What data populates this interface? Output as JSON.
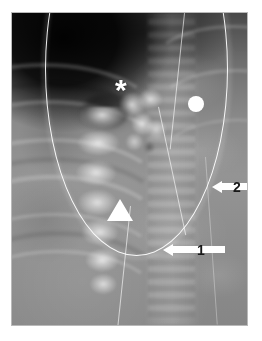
{
  "figure": {
    "type": "radiograph",
    "modality": "plain-film radiograph",
    "region": "chest / upper abdomen",
    "view": "frontal",
    "background_color": "#ffffff",
    "frame_border_color": "#b9b9b9"
  },
  "annotations": {
    "marker_color": "#ffffff",
    "label_text_color": "#1b1b1b",
    "items": [
      {
        "id": "asterisk",
        "glyph": "*",
        "shape": "asterisk",
        "label": "",
        "x": 113,
        "y": 78
      },
      {
        "id": "circle",
        "glyph": "",
        "shape": "filled-circle",
        "label": "",
        "x": 184,
        "y": 91
      },
      {
        "id": "triangle",
        "glyph": "",
        "shape": "filled-triangle-up",
        "label": "",
        "x": 108,
        "y": 197
      },
      {
        "id": "arrow-2",
        "glyph": "",
        "shape": "block-arrow-left",
        "label": "2",
        "x": 224,
        "y": 174
      },
      {
        "id": "arrow-1",
        "glyph": "",
        "shape": "block-arrow-left",
        "label": "1",
        "x": 182,
        "y": 237
      }
    ],
    "arrow_labels": {
      "arrow_1": "1",
      "arrow_2": "2"
    }
  }
}
